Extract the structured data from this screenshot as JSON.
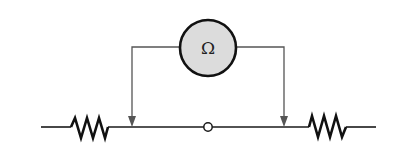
{
  "diagram": {
    "type": "circuit",
    "colors": {
      "background": "#ffffff",
      "wire": "#1a1a1a",
      "lead": "#555555",
      "meter_fill": "#dcdcdc",
      "meter_stroke": "#111111"
    },
    "meter": {
      "symbol": "Ω",
      "name": "ohmmeter",
      "icon": "ohmmeter-icon"
    },
    "components": [
      {
        "id": "resistor-left",
        "type": "resistor"
      },
      {
        "id": "node-center",
        "type": "open-node"
      },
      {
        "id": "resistor-right",
        "type": "resistor"
      }
    ],
    "leads": [
      {
        "id": "lead-left",
        "type": "probe-arrow"
      },
      {
        "id": "lead-right",
        "type": "probe-arrow"
      }
    ]
  }
}
